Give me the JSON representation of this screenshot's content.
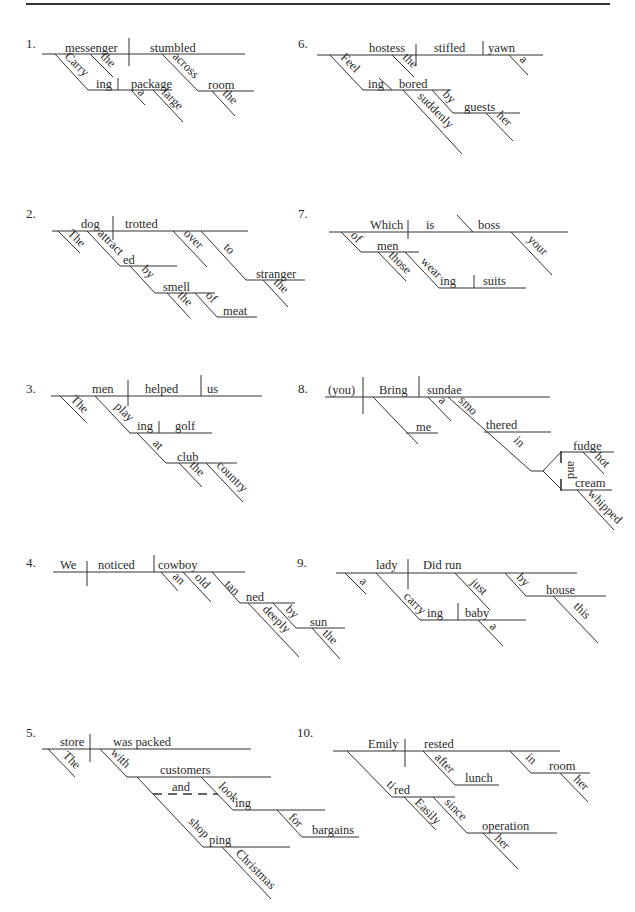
{
  "d1": {
    "num": "1.",
    "subject": "messenger",
    "verb": "stumbled",
    "mod_the": "the",
    "part_stem": "Carry",
    "part_end": "ing",
    "object": "package",
    "mod_a": "a",
    "mod_large": "large",
    "prep": "across",
    "prep_obj": "room",
    "mod_the2": "the"
  },
  "d2": {
    "num": "2.",
    "subject": "dog",
    "verb": "trotted",
    "mod_the": "The",
    "part_stem": "attract",
    "part_end": "ed",
    "prep_by": "by",
    "obj_smell": "smell",
    "mod_the2": "the",
    "prep_of": "of",
    "obj_meat": "meat",
    "adv_over": "over",
    "prep_to": "to",
    "obj_stranger": "stranger",
    "mod_the3": "the"
  },
  "d3": {
    "num": "3.",
    "subject": "men",
    "verb": "helped",
    "object": "us",
    "mod_the": "The",
    "part_stem": "play",
    "part_end": "ing",
    "part_obj": "golf",
    "prep_at": "at",
    "obj_club": "club",
    "mod_the2": "the",
    "mod_country": "country"
  },
  "d4": {
    "num": "4.",
    "subject": "We",
    "verb": "noticed",
    "object": "cowboy",
    "mod_an": "an",
    "mod_old": "old",
    "part_stem": "tan",
    "part_end": "ned",
    "adv_deeply": "deeply",
    "prep_by": "by",
    "obj_sun": "sun",
    "mod_the": "the"
  },
  "d5": {
    "num": "5.",
    "subject": "store",
    "verb": "was packed",
    "mod_the": "The",
    "prep_with": "with",
    "obj_customers": "customers",
    "conj_and": "and",
    "part1_stem": "look",
    "part1_end": "ing",
    "prep_for": "for",
    "obj_bargains": "bargains",
    "part2_stem": "shop",
    "part2_end": "ping",
    "mod_christmas": "Christmas"
  },
  "d6": {
    "num": "6.",
    "subject": "hostess",
    "verb": "stifled",
    "object": "yawn",
    "mod_the": "the",
    "mod_a": "a",
    "part_stem": "Feel",
    "part_end": "ing",
    "complement": "bored",
    "adv_suddenly": "suddenly",
    "prep_by": "by",
    "obj_guests": "guests",
    "mod_her": "her"
  },
  "d7": {
    "num": "7.",
    "subject": "Which",
    "verb": "is",
    "complement": "boss",
    "mod_your": "your",
    "prep_of": "of",
    "obj_men": "men",
    "mod_those": "those",
    "part_stem": "wear",
    "part_end": "ing",
    "part_obj": "suits"
  },
  "d8": {
    "num": "8.",
    "subject": "(you)",
    "verb": "Bring",
    "object": "sundae",
    "indirect": "me",
    "mod_a": "a",
    "part_stem": "smo",
    "part_end": "thered",
    "prep_in": "in",
    "conj_and": "and",
    "obj_fudge": "fudge",
    "mod_hot": "hot",
    "obj_cream": "cream",
    "mod_whipped": "whipped"
  },
  "d9": {
    "num": "9.",
    "subject": "lady",
    "verb": "Did run",
    "mod_a": "a",
    "adv_just": "just",
    "prep_by": "by",
    "obj_house": "house",
    "mod_this": "this",
    "part_stem": "carry",
    "part_end": "ing",
    "part_obj": "baby",
    "mod_a2": "a"
  },
  "d10": {
    "num": "10.",
    "subject": "Emily",
    "verb": "rested",
    "part_stem": "ti",
    "part_end": "red",
    "adv_easily": "Easily",
    "prep_since": "since",
    "obj_operation": "operation",
    "mod_her": "her",
    "prep_after": "after",
    "obj_lunch": "lunch",
    "prep_in": "in",
    "obj_room": "room",
    "mod_her2": "her"
  }
}
